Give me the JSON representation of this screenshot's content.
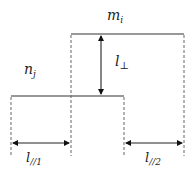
{
  "diagram": {
    "labels": {
      "upper_segment": "m",
      "upper_segment_sub": "i",
      "lower_segment": "n",
      "lower_segment_sub": "j",
      "perpendicular_distance": "l",
      "perpendicular_distance_sub": "⊥",
      "parallel_distance_1": "l",
      "parallel_distance_1_sub": "//1",
      "parallel_distance_2": "l",
      "parallel_distance_2_sub": "//2"
    },
    "colors": {
      "line": "#333333",
      "dashed": "#666666",
      "text": "#222222"
    }
  }
}
